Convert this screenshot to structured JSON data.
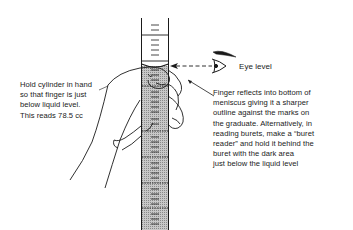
{
  "figure": {
    "eye_label": "Eye level",
    "left_note": {
      "lines": [
        "Hold cylinder in hand",
        "so that finger is just",
        "below liquid level.",
        "This reads 78.5 cc"
      ]
    },
    "right_note": {
      "lines": [
        "Finger reflects into bottom of",
        "meniscus giving it a sharper",
        "outline against the marks on",
        "the graduate. Alternatively, in",
        "reading burets, make a “buret",
        "reader” and hold it behind the",
        "buret with the dark area",
        "just below the liquid level"
      ]
    },
    "reading_value": "78.5 cc",
    "colors": {
      "ink": "#1a1a1a",
      "liquid_shade": "#bdbdbd",
      "background": "#ffffff"
    }
  }
}
